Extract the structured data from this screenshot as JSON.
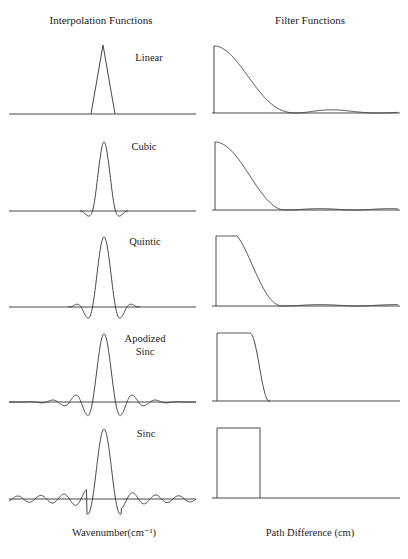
{
  "header": {
    "left_title": "Interpolation Functions",
    "right_title": "Filter Functions"
  },
  "footer": {
    "left_xlabel": "Wavenumber(cm⁻¹)",
    "right_xlabel": "Path Difference (cm)"
  },
  "rows": [
    {
      "label": "Linear"
    },
    {
      "label": "Cubic"
    },
    {
      "label": "Quintic"
    },
    {
      "label": "Apodized",
      "label2": "Sinc"
    },
    {
      "label": "Sinc"
    }
  ],
  "chart_data": [
    {
      "type": "line",
      "title": "Interpolation Functions",
      "xlabel": "Wavenumber(cm⁻¹)",
      "ylabel": "",
      "grid": false,
      "series": [
        {
          "name": "Linear",
          "shape": "triangle",
          "note": "triangular kernel, no side lobes"
        },
        {
          "name": "Cubic",
          "shape": "peak with one small negative lobe each side"
        },
        {
          "name": "Quintic",
          "shape": "peak with small negative lobes and faint secondary ripples"
        },
        {
          "name": "Apodized Sinc",
          "shape": "sinc with tapered side lobes"
        },
        {
          "name": "Sinc",
          "shape": "sinc with constant-amplitude side lobes"
        }
      ]
    },
    {
      "type": "line",
      "title": "Filter Functions",
      "xlabel": "Path Difference (cm)",
      "ylabel": "",
      "grid": false,
      "series": [
        {
          "name": "Linear",
          "shape": "sinc-squared rolloff, small secondary bump"
        },
        {
          "name": "Cubic",
          "shape": "smooth rolloff, faint secondary bump"
        },
        {
          "name": "Quintic",
          "shape": "flatter top, sharper rolloff, faint bump"
        },
        {
          "name": "Apodized Sinc",
          "shape": "flat top with steep smooth edge"
        },
        {
          "name": "Sinc",
          "shape": "ideal boxcar"
        }
      ]
    }
  ]
}
